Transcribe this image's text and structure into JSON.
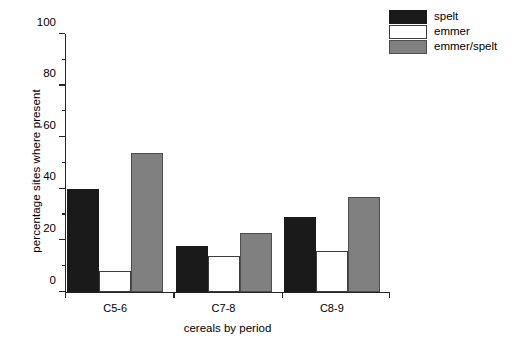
{
  "chart_data": {
    "type": "bar",
    "title": "",
    "subtitle": "",
    "xlabel": "cereals by period",
    "ylabel": "percentage sites where present",
    "categories": [
      "C5-6",
      "C7-8",
      "C8-9"
    ],
    "series": [
      {
        "name": "spelt",
        "color": "#1a1a1a",
        "values": [
          40,
          18,
          29
        ]
      },
      {
        "name": "emmer",
        "color": "#ffffff",
        "values": [
          8,
          14,
          16
        ]
      },
      {
        "name": "emmer/spelt",
        "color": "#808080",
        "values": [
          54,
          23,
          37
        ]
      }
    ],
    "ylim": [
      0,
      100
    ],
    "y_major_ticks": [
      0,
      20,
      40,
      60,
      80,
      100
    ],
    "y_minor_ticks": [
      10,
      30,
      50,
      70,
      90
    ],
    "y_tick_labels": [
      "0",
      "20",
      "40",
      "60",
      "80",
      "100"
    ],
    "grid": false,
    "legend_position": "top-right",
    "annotations": []
  }
}
